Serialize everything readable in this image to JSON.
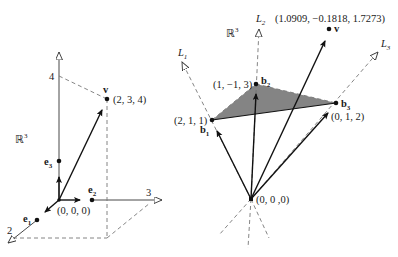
{
  "left_diagram": {
    "space_label": "ℝ",
    "space_sup": "3",
    "z_tick": "4",
    "y_tick": "3",
    "x_tick": "2",
    "vector_label": "v",
    "vector_coords": "(2, 3, 4)",
    "origin_label": "(0, 0, 0)",
    "basis": [
      {
        "name": "e",
        "sub": "1"
      },
      {
        "name": "e",
        "sub": "2"
      },
      {
        "name": "e",
        "sub": "3"
      }
    ]
  },
  "right_diagram": {
    "space_label": "ℝ",
    "space_sup": "3",
    "lines": [
      {
        "name": "L",
        "sub": "1"
      },
      {
        "name": "L",
        "sub": "2"
      },
      {
        "name": "L",
        "sub": "3"
      }
    ],
    "basis": [
      {
        "name": "b",
        "sub": "1",
        "coords": "(2, 1, 1)"
      },
      {
        "name": "b",
        "sub": "2",
        "coords": "(1, −1, 3)"
      },
      {
        "name": "b",
        "sub": "3",
        "coords": "(0, 1, 2)"
      }
    ],
    "vector_label": "v",
    "vector_coords": "(1.0909, −0.1818, 1.7273)",
    "origin_label": "(0, 0 ,0)",
    "plane_fill": "#6e6e6e"
  }
}
